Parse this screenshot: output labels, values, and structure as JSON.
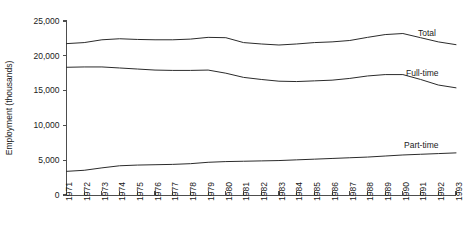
{
  "chart_data": {
    "type": "line",
    "title": "",
    "xlabel": "",
    "ylabel": "Employment (thousands)",
    "ylim": [
      0,
      25000
    ],
    "xlim": [
      1971,
      1993
    ],
    "grid": false,
    "legend_position": "right-inline",
    "y_ticks": [
      "0",
      "5,000",
      "10,000",
      "15,000",
      "20,000",
      "25,000"
    ],
    "y_tick_values": [
      0,
      5000,
      10000,
      15000,
      20000,
      25000
    ],
    "x": [
      1971,
      1972,
      1973,
      1974,
      1975,
      1976,
      1977,
      1978,
      1979,
      1980,
      1981,
      1982,
      1983,
      1984,
      1985,
      1986,
      1987,
      1988,
      1989,
      1990,
      1991,
      1992,
      1993
    ],
    "categories": [
      "1971",
      "1972",
      "1973",
      "1974",
      "1975",
      "1976",
      "1977",
      "1978",
      "1979",
      "1980",
      "1981",
      "1982",
      "1983",
      "1984",
      "1985",
      "1986",
      "1987",
      "1988",
      "1989",
      "1990",
      "1991",
      "1992",
      "1993"
    ],
    "series": [
      {
        "name": "Total",
        "values": [
          21750,
          21900,
          22300,
          22450,
          22350,
          22300,
          22300,
          22400,
          22650,
          22600,
          21900,
          21700,
          21550,
          21700,
          21900,
          22000,
          22200,
          22650,
          23050,
          23200,
          22600,
          22000,
          21600
        ]
      },
      {
        "name": "Full-time",
        "values": [
          18350,
          18400,
          18400,
          18250,
          18100,
          17950,
          17900,
          17900,
          17950,
          17500,
          16900,
          16600,
          16350,
          16300,
          16400,
          16500,
          16750,
          17100,
          17300,
          17300,
          16600,
          15800,
          15400
        ]
      },
      {
        "name": "Part-time",
        "values": [
          3400,
          3550,
          3900,
          4200,
          4300,
          4350,
          4400,
          4500,
          4700,
          4800,
          4850,
          4900,
          4950,
          5050,
          5150,
          5250,
          5350,
          5450,
          5600,
          5750,
          5850,
          5950,
          6050
        ]
      }
    ]
  },
  "series_labels": {
    "total": "Total",
    "full_time": "Full-time",
    "part_time": "Part-time"
  }
}
